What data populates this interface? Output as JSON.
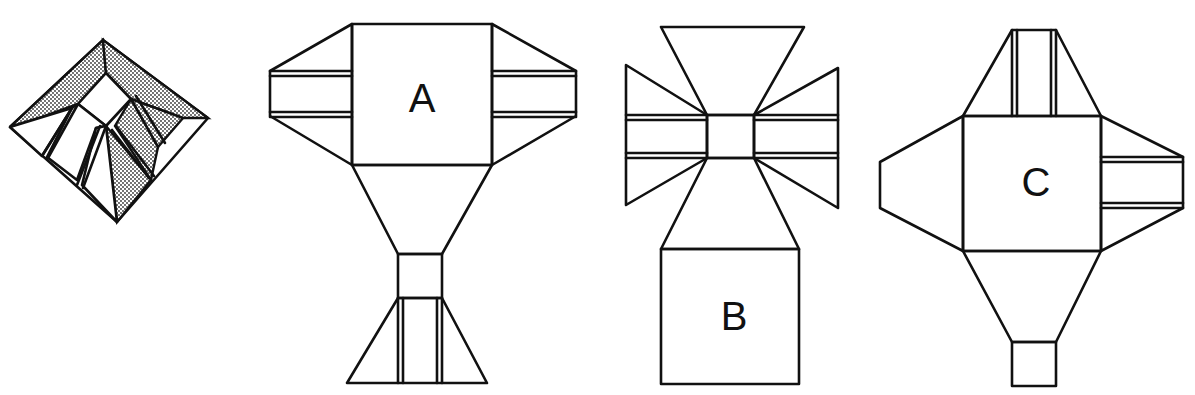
{
  "figure": {
    "model": {
      "name": "folded-model",
      "shading": "dotted"
    },
    "nets": [
      {
        "label": "A"
      },
      {
        "label": "B"
      },
      {
        "label": "C"
      }
    ]
  },
  "colors": {
    "line": "#111111",
    "background": "#ffffff",
    "shade": "#9a9a9a"
  }
}
